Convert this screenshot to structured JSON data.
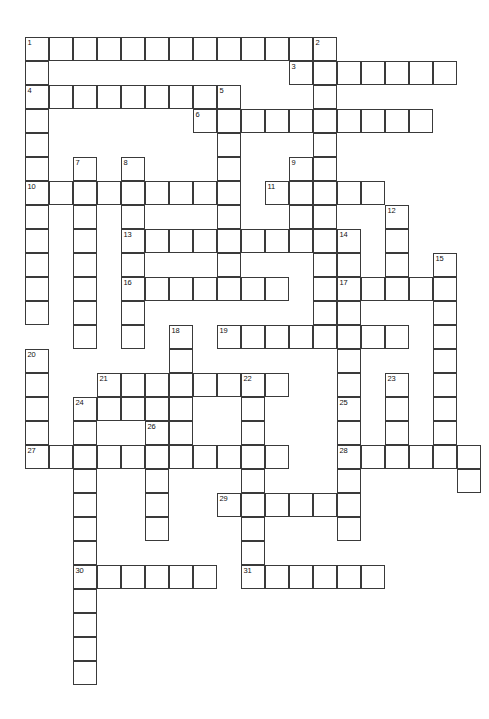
{
  "document": {
    "type": "crossword-puzzle-grid",
    "title": "",
    "background_color": "#ffffff",
    "cell_border_color": "#3a3a3a",
    "cell_fill_color": "#ffffff",
    "cell_size_px": 24,
    "grid_origin": {
      "x": 25,
      "y": 37
    },
    "grid_columns": 19,
    "grid_rows": 27,
    "clue_number_count": 31
  },
  "grid": {
    "note": "cells listed as [column, row] zero-based from grid_origin; all cells are empty (unfilled) white squares",
    "entries": [
      {
        "number": 1,
        "direction": "across",
        "row": 0,
        "col": 0,
        "length": 12
      },
      {
        "number": 1,
        "direction": "down",
        "row": 0,
        "col": 0,
        "length": 11
      },
      {
        "number": 2,
        "direction": "down",
        "row": 0,
        "col": 12,
        "length": 12
      },
      {
        "number": 3,
        "direction": "across",
        "row": 1,
        "col": 11,
        "length": 7
      },
      {
        "number": 4,
        "direction": "across",
        "row": 2,
        "col": 0,
        "length": 9
      },
      {
        "number": 5,
        "direction": "down",
        "row": 2,
        "col": 8,
        "length": 11
      },
      {
        "number": 6,
        "direction": "across",
        "row": 3,
        "col": 7,
        "length": 10
      },
      {
        "number": 7,
        "direction": "down",
        "row": 5,
        "col": 2,
        "length": 8
      },
      {
        "number": 8,
        "direction": "down",
        "row": 5,
        "col": 4,
        "length": 9
      },
      {
        "number": 9,
        "direction": "down",
        "row": 5,
        "col": 11,
        "length": 7
      },
      {
        "number": 10,
        "direction": "across",
        "row": 6,
        "col": 0,
        "length": 8
      },
      {
        "number": 11,
        "direction": "across",
        "row": 6,
        "col": 10,
        "length": 5
      },
      {
        "number": 12,
        "direction": "down",
        "row": 7,
        "col": 15,
        "length": 4
      },
      {
        "number": 13,
        "direction": "across",
        "row": 8,
        "col": 4,
        "length": 10
      },
      {
        "number": 14,
        "direction": "down",
        "row": 8,
        "col": 13,
        "length": 5
      },
      {
        "number": 15,
        "direction": "down",
        "row": 9,
        "col": 17,
        "length": 7
      },
      {
        "number": 16,
        "direction": "across",
        "row": 10,
        "col": 4,
        "length": 7
      },
      {
        "number": 17,
        "direction": "across",
        "row": 10,
        "col": 13,
        "length": 5
      },
      {
        "number": 18,
        "direction": "down",
        "row": 12,
        "col": 6,
        "length": 6
      },
      {
        "number": 19,
        "direction": "across",
        "row": 12,
        "col": 8,
        "length": 8
      },
      {
        "number": 20,
        "direction": "down",
        "row": 13,
        "col": 0,
        "length": 5
      },
      {
        "number": 21,
        "direction": "across",
        "row": 14,
        "col": 3,
        "length": 7
      },
      {
        "number": 22,
        "direction": "down",
        "row": 14,
        "col": 9,
        "length": 7
      },
      {
        "number": 23,
        "direction": "down",
        "row": 14,
        "col": 15,
        "length": 4
      },
      {
        "number": 24,
        "direction": "down",
        "row": 15,
        "col": 2,
        "length": 8
      },
      {
        "number": 25,
        "direction": "down",
        "row": 15,
        "col": 13,
        "length": 7
      },
      {
        "number": 26,
        "direction": "down",
        "row": 16,
        "col": 5,
        "length": 7
      },
      {
        "number": 27,
        "direction": "across",
        "row": 17,
        "col": 0,
        "length": 11
      },
      {
        "number": 28,
        "direction": "across",
        "row": 17,
        "col": 13,
        "length": 6
      },
      {
        "number": 29,
        "direction": "across",
        "row": 19,
        "col": 8,
        "length": 6
      },
      {
        "number": 30,
        "direction": "across",
        "row": 22,
        "col": 2,
        "length": 6
      },
      {
        "number": 31,
        "direction": "across",
        "row": 22,
        "col": 9,
        "length": 6
      }
    ],
    "cells": [
      {
        "c": 0,
        "r": 0,
        "n": "1"
      },
      {
        "c": 1,
        "r": 0
      },
      {
        "c": 2,
        "r": 0
      },
      {
        "c": 3,
        "r": 0
      },
      {
        "c": 4,
        "r": 0
      },
      {
        "c": 5,
        "r": 0
      },
      {
        "c": 6,
        "r": 0
      },
      {
        "c": 7,
        "r": 0
      },
      {
        "c": 8,
        "r": 0
      },
      {
        "c": 9,
        "r": 0
      },
      {
        "c": 10,
        "r": 0
      },
      {
        "c": 11,
        "r": 0
      },
      {
        "c": 12,
        "r": 0,
        "n": "2"
      },
      {
        "c": 0,
        "r": 1
      },
      {
        "c": 11,
        "r": 1,
        "n": "3"
      },
      {
        "c": 12,
        "r": 1
      },
      {
        "c": 13,
        "r": 1
      },
      {
        "c": 14,
        "r": 1
      },
      {
        "c": 15,
        "r": 1
      },
      {
        "c": 16,
        "r": 1
      },
      {
        "c": 17,
        "r": 1
      },
      {
        "c": 0,
        "r": 2,
        "n": "4"
      },
      {
        "c": 1,
        "r": 2
      },
      {
        "c": 2,
        "r": 2
      },
      {
        "c": 3,
        "r": 2
      },
      {
        "c": 4,
        "r": 2
      },
      {
        "c": 5,
        "r": 2
      },
      {
        "c": 6,
        "r": 2
      },
      {
        "c": 7,
        "r": 2
      },
      {
        "c": 8,
        "r": 2,
        "n": "5"
      },
      {
        "c": 12,
        "r": 2
      },
      {
        "c": 0,
        "r": 3
      },
      {
        "c": 7,
        "r": 3,
        "n": "6"
      },
      {
        "c": 8,
        "r": 3
      },
      {
        "c": 9,
        "r": 3
      },
      {
        "c": 10,
        "r": 3
      },
      {
        "c": 11,
        "r": 3
      },
      {
        "c": 12,
        "r": 3
      },
      {
        "c": 13,
        "r": 3
      },
      {
        "c": 14,
        "r": 3
      },
      {
        "c": 15,
        "r": 3
      },
      {
        "c": 16,
        "r": 3
      },
      {
        "c": 0,
        "r": 4
      },
      {
        "c": 8,
        "r": 4
      },
      {
        "c": 12,
        "r": 4
      },
      {
        "c": 0,
        "r": 5
      },
      {
        "c": 2,
        "r": 5,
        "n": "7"
      },
      {
        "c": 4,
        "r": 5,
        "n": "8"
      },
      {
        "c": 8,
        "r": 5
      },
      {
        "c": 11,
        "r": 5,
        "n": "9"
      },
      {
        "c": 12,
        "r": 5
      },
      {
        "c": 0,
        "r": 6,
        "n": "10"
      },
      {
        "c": 1,
        "r": 6
      },
      {
        "c": 2,
        "r": 6
      },
      {
        "c": 3,
        "r": 6
      },
      {
        "c": 4,
        "r": 6
      },
      {
        "c": 5,
        "r": 6
      },
      {
        "c": 6,
        "r": 6
      },
      {
        "c": 7,
        "r": 6
      },
      {
        "c": 8,
        "r": 6
      },
      {
        "c": 10,
        "r": 6,
        "n": "11"
      },
      {
        "c": 11,
        "r": 6
      },
      {
        "c": 12,
        "r": 6
      },
      {
        "c": 13,
        "r": 6
      },
      {
        "c": 14,
        "r": 6
      },
      {
        "c": 0,
        "r": 7
      },
      {
        "c": 2,
        "r": 7
      },
      {
        "c": 4,
        "r": 7
      },
      {
        "c": 8,
        "r": 7
      },
      {
        "c": 11,
        "r": 7
      },
      {
        "c": 12,
        "r": 7
      },
      {
        "c": 15,
        "r": 7,
        "n": "12"
      },
      {
        "c": 0,
        "r": 8
      },
      {
        "c": 2,
        "r": 8
      },
      {
        "c": 4,
        "r": 8,
        "n": "13"
      },
      {
        "c": 5,
        "r": 8
      },
      {
        "c": 6,
        "r": 8
      },
      {
        "c": 7,
        "r": 8
      },
      {
        "c": 8,
        "r": 8
      },
      {
        "c": 9,
        "r": 8
      },
      {
        "c": 10,
        "r": 8
      },
      {
        "c": 11,
        "r": 8
      },
      {
        "c": 12,
        "r": 8
      },
      {
        "c": 13,
        "r": 8,
        "n": "14"
      },
      {
        "c": 15,
        "r": 8
      },
      {
        "c": 0,
        "r": 9
      },
      {
        "c": 2,
        "r": 9
      },
      {
        "c": 4,
        "r": 9
      },
      {
        "c": 8,
        "r": 9
      },
      {
        "c": 12,
        "r": 9
      },
      {
        "c": 13,
        "r": 9
      },
      {
        "c": 15,
        "r": 9
      },
      {
        "c": 17,
        "r": 9,
        "n": "15"
      },
      {
        "c": 0,
        "r": 10
      },
      {
        "c": 2,
        "r": 10
      },
      {
        "c": 4,
        "r": 10,
        "n": "16"
      },
      {
        "c": 5,
        "r": 10
      },
      {
        "c": 6,
        "r": 10
      },
      {
        "c": 7,
        "r": 10
      },
      {
        "c": 8,
        "r": 10
      },
      {
        "c": 9,
        "r": 10
      },
      {
        "c": 10,
        "r": 10
      },
      {
        "c": 12,
        "r": 10
      },
      {
        "c": 13,
        "r": 10,
        "n": "17"
      },
      {
        "c": 14,
        "r": 10
      },
      {
        "c": 15,
        "r": 10
      },
      {
        "c": 16,
        "r": 10
      },
      {
        "c": 17,
        "r": 10
      },
      {
        "c": 0,
        "r": 11
      },
      {
        "c": 2,
        "r": 11
      },
      {
        "c": 4,
        "r": 11
      },
      {
        "c": 12,
        "r": 11
      },
      {
        "c": 13,
        "r": 11
      },
      {
        "c": 17,
        "r": 11
      },
      {
        "c": 2,
        "r": 12
      },
      {
        "c": 4,
        "r": 12
      },
      {
        "c": 6,
        "r": 12,
        "n": "18"
      },
      {
        "c": 8,
        "r": 12,
        "n": "19"
      },
      {
        "c": 9,
        "r": 12
      },
      {
        "c": 10,
        "r": 12
      },
      {
        "c": 11,
        "r": 12
      },
      {
        "c": 12,
        "r": 12
      },
      {
        "c": 13,
        "r": 12
      },
      {
        "c": 14,
        "r": 12
      },
      {
        "c": 15,
        "r": 12
      },
      {
        "c": 17,
        "r": 12
      },
      {
        "c": 0,
        "r": 13,
        "n": "20"
      },
      {
        "c": 6,
        "r": 13
      },
      {
        "c": 13,
        "r": 13
      },
      {
        "c": 17,
        "r": 13
      },
      {
        "c": 0,
        "r": 14
      },
      {
        "c": 3,
        "r": 14,
        "n": "21"
      },
      {
        "c": 4,
        "r": 14
      },
      {
        "c": 5,
        "r": 14
      },
      {
        "c": 6,
        "r": 14
      },
      {
        "c": 7,
        "r": 14
      },
      {
        "c": 8,
        "r": 14
      },
      {
        "c": 9,
        "r": 14,
        "n": "22"
      },
      {
        "c": 10,
        "r": 14
      },
      {
        "c": 13,
        "r": 14
      },
      {
        "c": 15,
        "r": 14,
        "n": "23"
      },
      {
        "c": 17,
        "r": 14
      },
      {
        "c": 0,
        "r": 15
      },
      {
        "c": 2,
        "r": 15,
        "n": "24"
      },
      {
        "c": 3,
        "r": 15
      },
      {
        "c": 4,
        "r": 15
      },
      {
        "c": 5,
        "r": 15
      },
      {
        "c": 6,
        "r": 15
      },
      {
        "c": 9,
        "r": 15
      },
      {
        "c": 13,
        "r": 15,
        "n": "25"
      },
      {
        "c": 15,
        "r": 15
      },
      {
        "c": 17,
        "r": 15
      },
      {
        "c": 0,
        "r": 16
      },
      {
        "c": 2,
        "r": 16
      },
      {
        "c": 5,
        "r": 16,
        "n": "26"
      },
      {
        "c": 6,
        "r": 16
      },
      {
        "c": 9,
        "r": 16
      },
      {
        "c": 13,
        "r": 16
      },
      {
        "c": 15,
        "r": 16
      },
      {
        "c": 17,
        "r": 16
      },
      {
        "c": 0,
        "r": 17,
        "n": "27"
      },
      {
        "c": 1,
        "r": 17
      },
      {
        "c": 2,
        "r": 17
      },
      {
        "c": 3,
        "r": 17
      },
      {
        "c": 4,
        "r": 17
      },
      {
        "c": 5,
        "r": 17
      },
      {
        "c": 6,
        "r": 17
      },
      {
        "c": 7,
        "r": 17
      },
      {
        "c": 8,
        "r": 17
      },
      {
        "c": 9,
        "r": 17
      },
      {
        "c": 10,
        "r": 17
      },
      {
        "c": 13,
        "r": 17,
        "n": "28"
      },
      {
        "c": 14,
        "r": 17
      },
      {
        "c": 15,
        "r": 17
      },
      {
        "c": 16,
        "r": 17
      },
      {
        "c": 17,
        "r": 17
      },
      {
        "c": 18,
        "r": 17
      },
      {
        "c": 2,
        "r": 18
      },
      {
        "c": 5,
        "r": 18
      },
      {
        "c": 9,
        "r": 18
      },
      {
        "c": 13,
        "r": 18
      },
      {
        "c": 18,
        "r": 18
      },
      {
        "c": 2,
        "r": 19
      },
      {
        "c": 5,
        "r": 19
      },
      {
        "c": 8,
        "r": 19,
        "n": "29"
      },
      {
        "c": 9,
        "r": 19
      },
      {
        "c": 10,
        "r": 19
      },
      {
        "c": 11,
        "r": 19
      },
      {
        "c": 12,
        "r": 19
      },
      {
        "c": 13,
        "r": 19
      },
      {
        "c": 2,
        "r": 20
      },
      {
        "c": 5,
        "r": 20
      },
      {
        "c": 9,
        "r": 20
      },
      {
        "c": 13,
        "r": 20
      },
      {
        "c": 2,
        "r": 21
      },
      {
        "c": 9,
        "r": 21
      },
      {
        "c": 2,
        "r": 22,
        "n": "30"
      },
      {
        "c": 3,
        "r": 22
      },
      {
        "c": 4,
        "r": 22
      },
      {
        "c": 5,
        "r": 22
      },
      {
        "c": 6,
        "r": 22
      },
      {
        "c": 7,
        "r": 22
      },
      {
        "c": 9,
        "r": 22,
        "n": "31"
      },
      {
        "c": 10,
        "r": 22
      },
      {
        "c": 11,
        "r": 22
      },
      {
        "c": 12,
        "r": 22
      },
      {
        "c": 13,
        "r": 22
      },
      {
        "c": 14,
        "r": 22
      },
      {
        "c": 2,
        "r": 23
      },
      {
        "c": 2,
        "r": 24
      },
      {
        "c": 2,
        "r": 25
      },
      {
        "c": 2,
        "r": 26
      }
    ]
  }
}
